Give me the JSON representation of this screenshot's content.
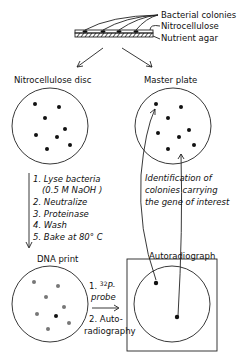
{
  "top_layers": {
    "labels": [
      "Bacterial colonies",
      "Nitrocellulose",
      "Nutrient agar"
    ]
  },
  "panels": {
    "nitrocellulose_disc": {
      "title": "Nitrocellulose disc"
    },
    "master_plate": {
      "title": "Master plate"
    },
    "dna_print": {
      "title": "DNA print"
    },
    "autoradiograph": {
      "title": "Autoradiograph"
    }
  },
  "steps": {
    "lines": [
      "1. Lyse bacteria",
      "(0.5 M NaOH )",
      "2. Neutralize",
      "3. Proteinase",
      "4. Wash",
      "5. Bake at 80° C"
    ]
  },
  "probe_steps": {
    "line1": "1. ",
    "isotope_sup": "32",
    "line1_rest": "P-",
    "line2": "probe",
    "line3": "2. Auto-",
    "line4": "radiography"
  },
  "identification": {
    "lines": [
      "Identification of",
      "colonies carrying",
      "the gene of interest"
    ]
  },
  "colors": {
    "ink": "#222222",
    "background": "#ffffff"
  }
}
